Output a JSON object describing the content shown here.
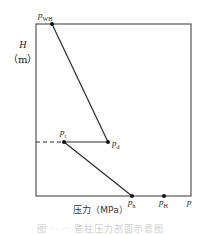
{
  "diagram": {
    "y_axis": {
      "symbol": "H",
      "unit": "（m）"
    },
    "x_axis": {
      "label": "压力（MPa）",
      "end_symbol": "p"
    },
    "points": {
      "wellhead": {
        "base": "p",
        "sub": "WH"
      },
      "turning": {
        "base": "p",
        "sub": "t"
      },
      "delivery": {
        "base": "p",
        "sub": "d"
      },
      "hydrostatic": {
        "base": "p",
        "sub": "h"
      },
      "high": {
        "base": "p",
        "sub": "H"
      }
    },
    "caption": "图 ·· ·· 管柱压力剖面示意图"
  },
  "colors": {
    "line": "#2a2a2a",
    "frame": "#555555",
    "caption": "#cfcfcf"
  }
}
